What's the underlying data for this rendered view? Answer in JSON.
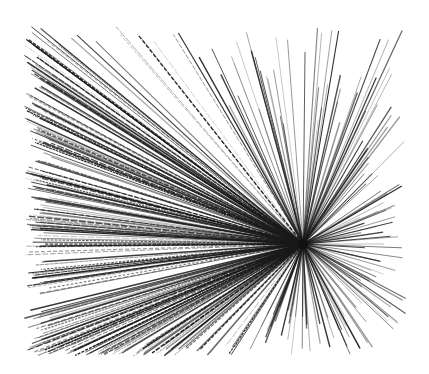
{
  "image": {
    "description": "Black ink radial line burst (starburst) on white background",
    "background": "#ffffff",
    "ink_color": "#1a1a1a",
    "canvas": {
      "width": 429,
      "height": 374
    },
    "center": {
      "x": 303,
      "y": 244
    },
    "extent": {
      "left": 24,
      "top": 25,
      "right": 406,
      "bottom": 356
    },
    "line_count": 420,
    "seed": 7
  }
}
